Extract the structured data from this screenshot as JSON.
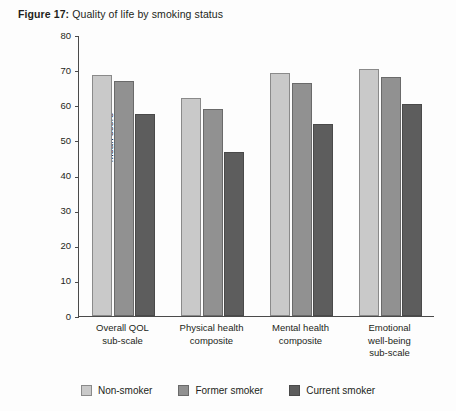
{
  "figure": {
    "label": "Figure 17:",
    "caption": "Quality of life by smoking status"
  },
  "chart_data": {
    "type": "bar",
    "title": "Quality of life by smoking status",
    "xlabel": "",
    "ylabel": "Mean score",
    "ylim": [
      0,
      80
    ],
    "yticks": [
      0,
      10,
      20,
      30,
      40,
      50,
      60,
      70,
      80
    ],
    "grid": false,
    "legend_position": "bottom",
    "categories": [
      "Overall QOL\nsub-scale",
      "Physical health\ncomposite",
      "Mental health\ncomposite",
      "Emotional\nwell-being\nsub-scale"
    ],
    "series": [
      {
        "name": "Non-smoker",
        "color": "#c9c9c9",
        "values": [
          68.5,
          62.0,
          69.2,
          70.2
        ]
      },
      {
        "name": "Former smoker",
        "color": "#919191",
        "values": [
          67.0,
          58.8,
          66.3,
          68.0
        ]
      },
      {
        "name": "Current smoker",
        "color": "#5d5d5d",
        "values": [
          57.6,
          46.7,
          54.7,
          60.3
        ]
      }
    ]
  }
}
